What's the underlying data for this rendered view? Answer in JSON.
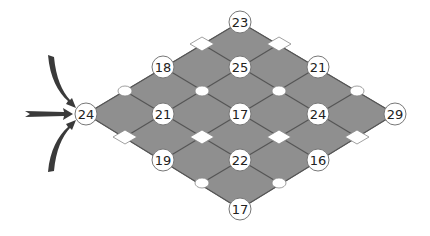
{
  "colors": {
    "fill": "#8f8f8f",
    "grid_line": "#555555",
    "node_fill": "#ffffff",
    "node_stroke": "#777777",
    "arrow": "#3a3a3a",
    "marker_fill": "#ffffff",
    "marker_stroke": "#888888"
  },
  "outline": {
    "left": [
      86,
      114
    ],
    "top": [
      240,
      22
    ],
    "right": [
      395,
      114
    ],
    "bottom": [
      240,
      209
    ]
  },
  "nodes": [
    {
      "id": "n-top",
      "label": "23",
      "x": 240,
      "y": 22
    },
    {
      "id": "n-r1-left",
      "label": "18",
      "x": 163,
      "y": 67
    },
    {
      "id": "n-r1-mid",
      "label": "25",
      "x": 240,
      "y": 67
    },
    {
      "id": "n-r1-right",
      "label": "21",
      "x": 318,
      "y": 67
    },
    {
      "id": "n-start",
      "label": "24",
      "x": 86,
      "y": 114
    },
    {
      "id": "n-r2-a",
      "label": "21",
      "x": 163,
      "y": 114
    },
    {
      "id": "n-r2-b",
      "label": "17",
      "x": 240,
      "y": 114
    },
    {
      "id": "n-r2-c",
      "label": "24",
      "x": 318,
      "y": 114
    },
    {
      "id": "n-end",
      "label": "29",
      "x": 395,
      "y": 114
    },
    {
      "id": "n-r3-left",
      "label": "19",
      "x": 163,
      "y": 160
    },
    {
      "id": "n-r3-mid",
      "label": "22",
      "x": 240,
      "y": 160
    },
    {
      "id": "n-r3-right",
      "label": "16",
      "x": 318,
      "y": 160
    },
    {
      "id": "n-bottom",
      "label": "17",
      "x": 240,
      "y": 209
    }
  ],
  "markers": {
    "diamonds": [
      {
        "x": 202,
        "y": 44
      },
      {
        "x": 279,
        "y": 44
      },
      {
        "x": 125,
        "y": 137
      },
      {
        "x": 202,
        "y": 137
      },
      {
        "x": 279,
        "y": 137
      },
      {
        "x": 357,
        "y": 137
      }
    ],
    "ovals": [
      {
        "x": 125,
        "y": 91
      },
      {
        "x": 202,
        "y": 91
      },
      {
        "x": 279,
        "y": 91
      },
      {
        "x": 357,
        "y": 91
      },
      {
        "x": 202,
        "y": 183
      },
      {
        "x": 279,
        "y": 183
      }
    ]
  },
  "arrows": [
    {
      "name": "arrow-from-top",
      "direction": "curved-down"
    },
    {
      "name": "arrow-from-left",
      "direction": "straight-right"
    },
    {
      "name": "arrow-from-bottom",
      "direction": "curved-up"
    }
  ]
}
